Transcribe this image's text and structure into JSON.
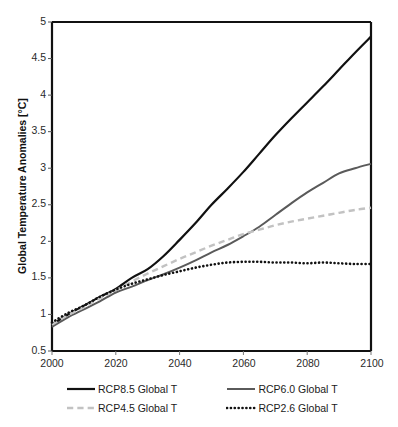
{
  "chart_data": {
    "type": "line",
    "title": "",
    "xlabel": "",
    "ylabel": "Global Temperature Anomalies [°C]",
    "xlim": [
      2000,
      2100
    ],
    "ylim": [
      0.5,
      5
    ],
    "xticks": [
      "2000",
      "2020",
      "2040",
      "2060",
      "2080",
      "2100"
    ],
    "yticks": [
      "0.5",
      "1",
      "1.5",
      "2",
      "2.5",
      "3",
      "3.5",
      "4",
      "4.5",
      "5"
    ],
    "grid": false,
    "legend_position": "bottom",
    "x": [
      2000,
      2005,
      2010,
      2015,
      2020,
      2025,
      2030,
      2035,
      2040,
      2045,
      2050,
      2055,
      2060,
      2065,
      2070,
      2075,
      2080,
      2085,
      2090,
      2095,
      2100
    ],
    "series": [
      {
        "name": "RCP8.5 Global T",
        "color": "#111111",
        "style": "solid",
        "width": 2.2,
        "values": [
          0.86,
          1.0,
          1.12,
          1.24,
          1.35,
          1.5,
          1.62,
          1.8,
          2.02,
          2.25,
          2.5,
          2.72,
          2.95,
          3.2,
          3.45,
          3.68,
          3.9,
          4.12,
          4.35,
          4.58,
          4.8
        ]
      },
      {
        "name": "RCP6.0  Global T",
        "color": "#5a5a5a",
        "style": "solid",
        "width": 2.0,
        "values": [
          0.83,
          0.96,
          1.07,
          1.18,
          1.3,
          1.38,
          1.47,
          1.55,
          1.64,
          1.74,
          1.85,
          1.95,
          2.07,
          2.2,
          2.36,
          2.52,
          2.67,
          2.8,
          2.93,
          3.0,
          3.06
        ]
      },
      {
        "name": "RCP4.5  Global T",
        "color": "#c2c2c2",
        "style": "dashed",
        "width": 2.4,
        "values": [
          0.86,
          0.99,
          1.1,
          1.22,
          1.33,
          1.45,
          1.56,
          1.66,
          1.76,
          1.85,
          1.94,
          2.02,
          2.1,
          2.16,
          2.22,
          2.27,
          2.31,
          2.35,
          2.39,
          2.43,
          2.46
        ]
      },
      {
        "name": "RCP2.6  Global T",
        "color": "#111111",
        "style": "dotted",
        "width": 2.6,
        "values": [
          0.89,
          1.02,
          1.12,
          1.24,
          1.34,
          1.42,
          1.48,
          1.54,
          1.59,
          1.64,
          1.68,
          1.71,
          1.72,
          1.72,
          1.71,
          1.71,
          1.7,
          1.71,
          1.7,
          1.69,
          1.69
        ]
      }
    ]
  },
  "axis": {
    "y_title": "Global Temperature Anomalies [°C]",
    "y_labels": [
      "5",
      "4.5",
      "4",
      "3.5",
      "3",
      "2.5",
      "2",
      "1.5",
      "1",
      "0.5"
    ],
    "x_labels": [
      "2000",
      "2020",
      "2040",
      "2060",
      "2080",
      "2100"
    ]
  },
  "legend": {
    "items": [
      {
        "label": "RCP8.5 Global T",
        "color": "#111111",
        "style": "solid"
      },
      {
        "label": "RCP6.0  Global T",
        "color": "#5a5a5a",
        "style": "solid"
      },
      {
        "label": "RCP4.5  Global T",
        "color": "#c2c2c2",
        "style": "dashed"
      },
      {
        "label": "RCP2.6  Global T",
        "color": "#111111",
        "style": "dotted"
      }
    ]
  }
}
